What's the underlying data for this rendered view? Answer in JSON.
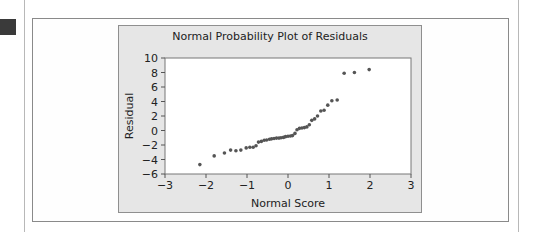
{
  "chart_data": {
    "type": "scatter",
    "title": "Normal Probability Plot of Residuals",
    "xlabel": "Normal Score",
    "ylabel": "Residual",
    "xlim": [
      -3,
      3
    ],
    "ylim": [
      -6,
      10
    ],
    "xticks": [
      -3,
      -2,
      -1,
      0,
      1,
      2,
      3
    ],
    "yticks": [
      10,
      8,
      6,
      4,
      2,
      0,
      -2,
      -4,
      -6
    ],
    "xtick_labels": [
      "−3",
      "−2",
      "−1",
      "0",
      "1",
      "2",
      "3"
    ],
    "ytick_labels": [
      "10",
      "8",
      "6",
      "4",
      "2",
      "0",
      "−2",
      "−4",
      "−6"
    ],
    "grid": false,
    "legend": null,
    "series": [
      {
        "name": "Residuals",
        "color": "#555555",
        "points": [
          [
            -2.15,
            -4.7
          ],
          [
            -1.8,
            -3.5
          ],
          [
            -1.55,
            -3.1
          ],
          [
            -1.4,
            -2.7
          ],
          [
            -1.27,
            -2.8
          ],
          [
            -1.15,
            -2.7
          ],
          [
            -1.02,
            -2.4
          ],
          [
            -0.93,
            -2.3
          ],
          [
            -0.85,
            -2.3
          ],
          [
            -0.78,
            -2.1
          ],
          [
            -0.72,
            -1.6
          ],
          [
            -0.65,
            -1.5
          ],
          [
            -0.58,
            -1.35
          ],
          [
            -0.52,
            -1.3
          ],
          [
            -0.45,
            -1.2
          ],
          [
            -0.4,
            -1.15
          ],
          [
            -0.34,
            -1.1
          ],
          [
            -0.28,
            -1.05
          ],
          [
            -0.22,
            -1.05
          ],
          [
            -0.17,
            -1.0
          ],
          [
            -0.11,
            -0.95
          ],
          [
            -0.06,
            -0.85
          ],
          [
            0.0,
            -0.8
          ],
          [
            0.06,
            -0.75
          ],
          [
            0.11,
            -0.7
          ],
          [
            0.17,
            -0.4
          ],
          [
            0.22,
            0.1
          ],
          [
            0.28,
            0.3
          ],
          [
            0.34,
            0.35
          ],
          [
            0.4,
            0.4
          ],
          [
            0.46,
            0.5
          ],
          [
            0.52,
            0.8
          ],
          [
            0.58,
            1.4
          ],
          [
            0.65,
            1.6
          ],
          [
            0.72,
            2.0
          ],
          [
            0.8,
            2.7
          ],
          [
            0.88,
            2.8
          ],
          [
            0.97,
            3.5
          ],
          [
            1.07,
            4.1
          ],
          [
            1.2,
            4.2
          ],
          [
            1.37,
            7.9
          ],
          [
            1.62,
            8.0
          ],
          [
            1.98,
            8.4
          ]
        ]
      }
    ]
  },
  "colors": {
    "panel_bg": "#e6e6e6",
    "plot_bg": "#ffffff",
    "marker": "#555555",
    "text": "#222222"
  }
}
